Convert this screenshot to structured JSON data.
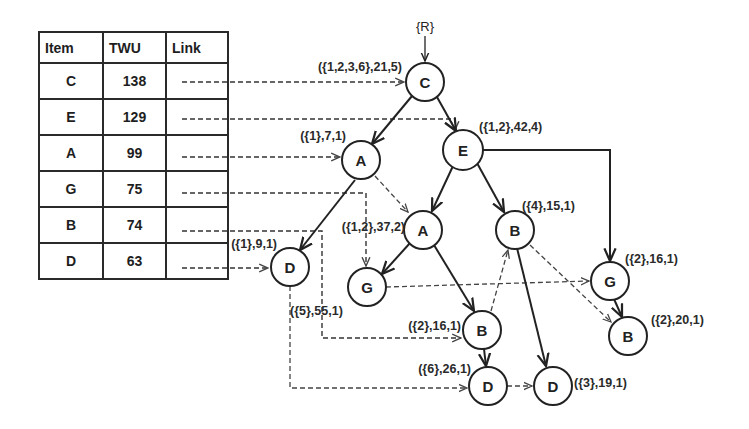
{
  "table": {
    "headers": [
      "Item",
      "TWU",
      "Link"
    ],
    "rows": [
      {
        "item": "C",
        "twu": "138"
      },
      {
        "item": "E",
        "twu": "129"
      },
      {
        "item": "A",
        "twu": "99"
      },
      {
        "item": "G",
        "twu": "75"
      },
      {
        "item": "B",
        "twu": "74"
      },
      {
        "item": "D",
        "twu": "63"
      }
    ]
  },
  "tree": {
    "root_label": "{R}",
    "nodes": [
      {
        "id": "n_c",
        "item": "C",
        "annotation": "({1,2,3,6},21,5)"
      },
      {
        "id": "n_a1",
        "item": "A",
        "annotation": "({1},7,1)"
      },
      {
        "id": "n_e",
        "item": "E",
        "annotation": "({1,2},42,4)"
      },
      {
        "id": "n_a2",
        "item": "A",
        "annotation": "({1,2},37,2)"
      },
      {
        "id": "n_b1",
        "item": "B",
        "annotation": "({4},15,1)"
      },
      {
        "id": "n_d1",
        "item": "D",
        "annotation": "({1},9,1)"
      },
      {
        "id": "n_g1",
        "item": "G",
        "annotation": "({5},55,1)"
      },
      {
        "id": "n_g2",
        "item": "G",
        "annotation": "({2},16,1)"
      },
      {
        "id": "n_b2",
        "item": "B",
        "annotation": "({2},16,1)"
      },
      {
        "id": "n_b3",
        "item": "B",
        "annotation": "({2},20,1)"
      },
      {
        "id": "n_d2",
        "item": "D",
        "annotation": "({6},26,1)"
      },
      {
        "id": "n_d3",
        "item": "D",
        "annotation": "({3},19,1)"
      }
    ]
  },
  "colors": {
    "ink": "#222222",
    "background": "#ffffff"
  }
}
